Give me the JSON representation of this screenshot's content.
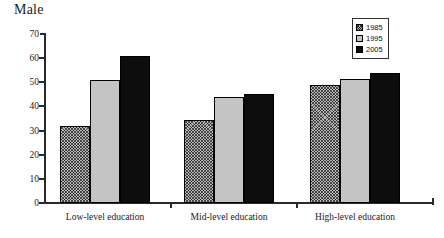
{
  "chart_data": {
    "type": "bar",
    "title": "Male",
    "xlabel": "",
    "ylabel": "",
    "ylim": [
      0,
      70
    ],
    "yticks": [
      0,
      10,
      20,
      30,
      40,
      50,
      60,
      70
    ],
    "grid": false,
    "legend_position": "top-right",
    "categories": [
      "Low-level education",
      "Mid-level education",
      "High-level education"
    ],
    "series": [
      {
        "name": "1985",
        "values": [
          32,
          34.5,
          49
        ],
        "fill": "hatched",
        "color": "#b9b9b9"
      },
      {
        "name": "1995",
        "values": [
          51,
          44,
          51.5
        ],
        "fill": "light-gray",
        "color": "#c4c4c4"
      },
      {
        "name": "2005",
        "values": [
          61,
          45,
          54
        ],
        "fill": "solid-black",
        "color": "#0d0d0d"
      }
    ]
  },
  "legend": {
    "items": [
      {
        "label": "1985"
      },
      {
        "label": "1995"
      },
      {
        "label": "2005"
      }
    ]
  }
}
